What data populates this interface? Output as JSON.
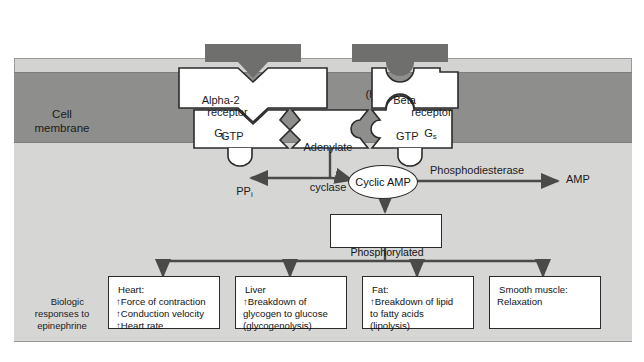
{
  "diagram": {
    "region_labels": {
      "cell_membrane": "Cell\nmembrane",
      "biologic_responses": "Biologic\nresponses to\nepinephrine"
    },
    "hormones": [
      {
        "name": "Norepinephrine",
        "qualifier": "(hormone)"
      },
      {
        "name": "Epinephrine",
        "qualifier": "(hormone)"
      }
    ],
    "receptors": [
      {
        "name": "Alpha-2",
        "suffix": "receptor"
      },
      {
        "name": "Beta",
        "suffix": "receptor"
      }
    ],
    "g_proteins": [
      {
        "label": "G",
        "subscript": "i",
        "nucleotide": "GTP"
      },
      {
        "label": "G",
        "subscript": "s",
        "nucleotide": "GTP"
      }
    ],
    "enzyme": {
      "line1": "Adenylate",
      "line2": "cyclase"
    },
    "second_messenger": "Cyclic AMP",
    "byproduct": {
      "label": "PP",
      "subscript": "i"
    },
    "degradation_enzyme": "Phosphodiesterase",
    "degradation_product": "AMP",
    "effector": {
      "line1": "Phosphorylated",
      "line2": "enzymes"
    },
    "responses": [
      {
        "tissue": "Heart:",
        "effects": "↑Force of contraction\n↑Conduction velocity\n↑Heart rate"
      },
      {
        "tissue": "Liver",
        "effects": "↑Breakdown of\nglycogen to glucose\n(glycogenolysis)"
      },
      {
        "tissue": "Fat:",
        "effects": "↑Breakdown of lipid\nto fatty acids\n(lipolysis)"
      },
      {
        "tissue": "Smooth muscle:",
        "effects": "Relaxation"
      }
    ],
    "colors": {
      "membrane": "#8e8e8c",
      "cytosol": "#d6d6d4",
      "extracellular": "#d3d3d1",
      "hormone_bar": "#6f6f6d",
      "stroke": "#2b2b2b",
      "text": "#121212"
    }
  }
}
